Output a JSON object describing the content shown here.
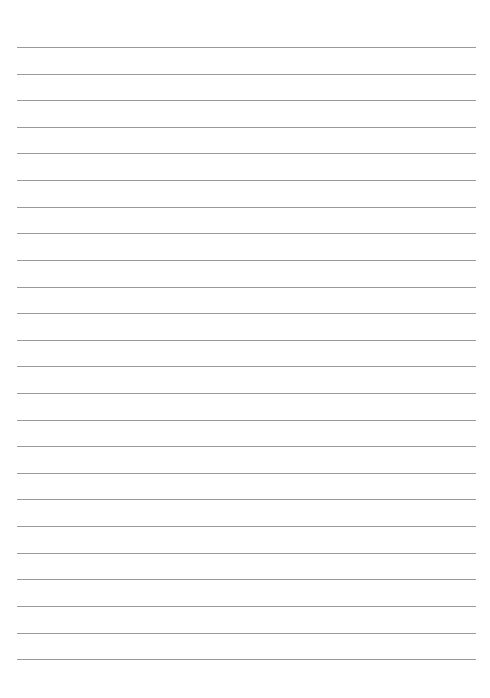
{
  "page": {
    "type": "lined-paper",
    "background_color": "#ffffff",
    "line_color": "#8f8f8f",
    "line_count": 24,
    "line_left": 17,
    "line_right": 476,
    "line_positions": [
      47,
      74,
      100,
      127,
      153,
      180,
      207,
      233,
      260,
      287,
      313,
      340,
      366,
      393,
      420,
      446,
      473,
      499,
      526,
      553,
      579,
      606,
      633,
      659
    ]
  }
}
